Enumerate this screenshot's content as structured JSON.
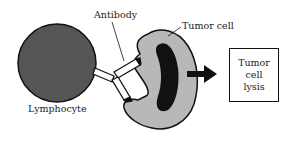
{
  "diagram": {
    "labels": {
      "antibody": "Antibody",
      "tumor_cell": "Tumor cell",
      "lymphocyte": "Lymphocyte"
    },
    "result": {
      "lines": [
        "Tumor",
        "cell",
        "lysis"
      ]
    },
    "colors": {
      "lymphocyte_fill": "#555555",
      "tumor_cell_fill": "#b8b8b8",
      "nucleus_fill": "#111111",
      "outline": "#111111",
      "background": "#ffffff"
    },
    "icons": {
      "arrow": "right-arrow"
    }
  }
}
